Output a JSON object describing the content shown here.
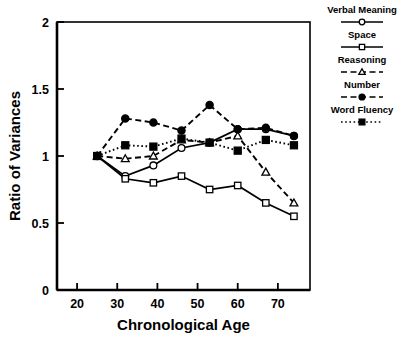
{
  "chart_data": {
    "type": "line",
    "title": "",
    "xlabel": "Chronological Age",
    "ylabel": "Ratio of Variances",
    "xlim": [
      15,
      78
    ],
    "ylim": [
      0,
      2
    ],
    "xticks": [
      20,
      30,
      40,
      50,
      60,
      70
    ],
    "yticks": [
      0,
      0.5,
      1,
      1.5,
      2
    ],
    "ytick_labels": [
      "0",
      "0.5",
      "1",
      "1.5",
      "2"
    ],
    "xtick_labels": [
      "20",
      "30",
      "40",
      "50",
      "60",
      "70"
    ],
    "grid": false,
    "legend_position": "right-outside",
    "x": [
      25,
      32,
      39,
      46,
      53,
      60,
      67,
      74
    ],
    "series": [
      {
        "name": "Verbal Meaning",
        "marker": "open-circle",
        "line": "solid",
        "values": [
          1.0,
          0.85,
          0.93,
          1.06,
          1.1,
          1.2,
          1.2,
          1.15
        ]
      },
      {
        "name": "Space",
        "marker": "open-square",
        "line": "solid",
        "values": [
          1.0,
          0.83,
          0.8,
          0.85,
          0.75,
          0.78,
          0.65,
          0.55
        ]
      },
      {
        "name": "Reasoning",
        "marker": "open-triangle",
        "line": "dashed",
        "values": [
          1.0,
          0.98,
          1.0,
          1.12,
          1.1,
          1.15,
          0.88,
          0.65
        ]
      },
      {
        "name": "Number",
        "marker": "filled-circle",
        "line": "dashed",
        "values": [
          1.0,
          1.28,
          1.25,
          1.19,
          1.38,
          1.2,
          1.21,
          1.15
        ]
      },
      {
        "name": "Word Fluency",
        "marker": "filled-square",
        "line": "dotted",
        "values": [
          1.0,
          1.08,
          1.07,
          1.13,
          1.1,
          1.04,
          1.12,
          1.08
        ]
      }
    ],
    "legend": [
      {
        "label": "Verbal Meaning",
        "marker": "open-circle",
        "line": "solid"
      },
      {
        "label": "Space",
        "marker": "open-square",
        "line": "solid"
      },
      {
        "label": "Reasoning",
        "marker": "open-triangle",
        "line": "dashed"
      },
      {
        "label": "Number",
        "marker": "filled-circle",
        "line": "dashed"
      },
      {
        "label": "Word Fluency",
        "marker": "filled-square",
        "line": "dotted"
      }
    ],
    "colors": {
      "line": "#000000",
      "axis": "#000000",
      "background": "#ffffff"
    }
  }
}
